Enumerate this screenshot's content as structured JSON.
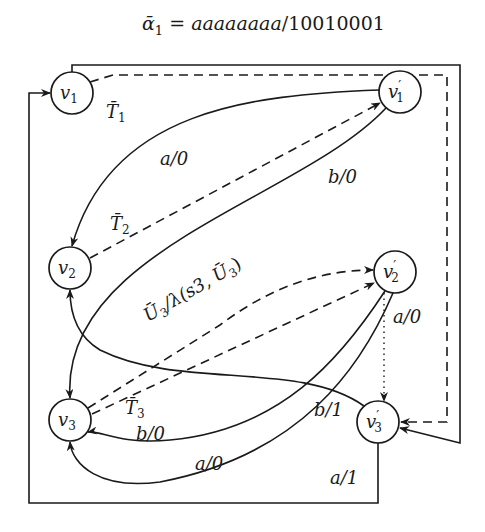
{
  "title": {
    "alpha": "ᾱ",
    "sub": "1",
    "eq": " = ",
    "input": "aaaaaaaa",
    "slash": "/",
    "output": "10010001"
  },
  "nodes": [
    {
      "id": "v1",
      "base": "v",
      "sub": "1",
      "prime": ""
    },
    {
      "id": "v1p",
      "base": "v",
      "sub": "1",
      "prime": "′"
    },
    {
      "id": "v2",
      "base": "v",
      "sub": "2",
      "prime": ""
    },
    {
      "id": "v2p",
      "base": "v",
      "sub": "2",
      "prime": "′"
    },
    {
      "id": "v3",
      "base": "v",
      "sub": "3",
      "prime": ""
    },
    {
      "id": "v3p",
      "base": "v",
      "sub": "3",
      "prime": "′"
    }
  ],
  "edge_labels": {
    "T1": {
      "base": "T̄",
      "sub": "1"
    },
    "T2": {
      "base": "T̄",
      "sub": "2"
    },
    "T3": {
      "base": "T̄",
      "sub": "3"
    },
    "a0_v1p_v2": "a/0",
    "b0_v1p_v3": "b/0",
    "U3": {
      "base": "Ū",
      "sub": "3",
      "rest": "/λ(s3, ",
      "base2": "Ū",
      "sub2": "3",
      "close": ")"
    },
    "a0_v2p_v3p": "a/0",
    "b0_v2p_v3": "b/0",
    "a0_v2p_v3_lower": "a/0",
    "b1_v3p_v2": "b/1",
    "a1_v3p_v1": "a/1"
  }
}
